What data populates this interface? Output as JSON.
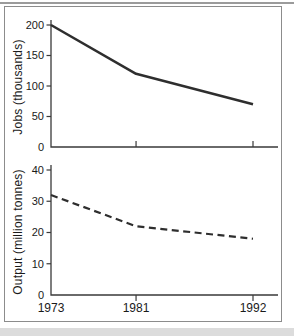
{
  "figure": {
    "top_ylabel": "Jobs (thousands)",
    "bottom_ylabel": "Output (million tonnes)"
  },
  "colors": {
    "line": "#2e2e2e",
    "axis": "#3a3a3a",
    "tick_label": "#1a1a1a",
    "panel_border": "#8c8c8c",
    "top_rule": "#9b9b9b",
    "bottom_strip": "#dcdcdc"
  },
  "chart_data": [
    {
      "type": "line",
      "title": "",
      "x": [
        1973,
        1981,
        1992
      ],
      "x_tick_labels": [
        "1973",
        "1981",
        "1992"
      ],
      "show_x_tick_labels": false,
      "values": [
        200,
        120,
        70
      ],
      "ylabel": "Jobs (thousands)",
      "xlabel": "",
      "yticks": [
        0,
        50,
        100,
        150,
        200
      ],
      "ylim": [
        0,
        200
      ],
      "xlim": [
        1973,
        1994
      ],
      "line_style": "solid",
      "grid": false,
      "legend": "none"
    },
    {
      "type": "line",
      "title": "",
      "x": [
        1973,
        1981,
        1992
      ],
      "x_tick_labels": [
        "1973",
        "1981",
        "1992"
      ],
      "show_x_tick_labels": true,
      "values": [
        32,
        22,
        18
      ],
      "ylabel": "Output (million tonnes)",
      "xlabel": "",
      "yticks": [
        0,
        10,
        20,
        30,
        40
      ],
      "ylim": [
        0,
        40
      ],
      "xlim": [
        1973,
        1994
      ],
      "line_style": "dashed",
      "grid": false,
      "legend": "none"
    }
  ]
}
